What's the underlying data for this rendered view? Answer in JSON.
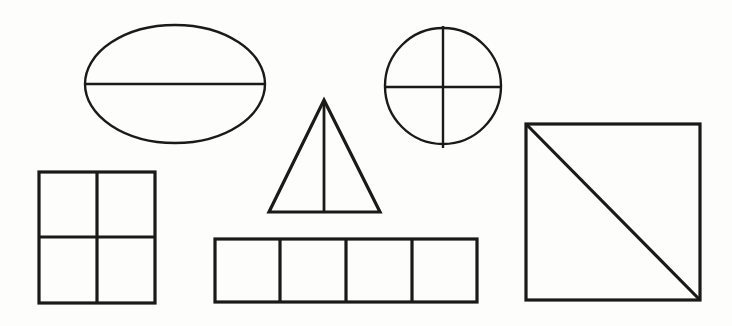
{
  "diagram": {
    "background_color": "#fdfdfc",
    "stroke_color": "#1a1a1a",
    "fill_color": "none",
    "width": 732,
    "height": 326
  },
  "shapes": [
    {
      "id": "ellipse-halves",
      "name": "ellipse",
      "label": "Ellipse divided into halves",
      "parts": 2,
      "fraction": "1/2",
      "division": "horizontal-line",
      "geometry": {
        "cx": 175,
        "cy": 84,
        "rx": 90,
        "ry": 59,
        "stroke_width": 2.4
      },
      "dividers": [
        {
          "x1": 85,
          "y1": 84,
          "x2": 265,
          "y2": 84,
          "stroke_width": 2.4
        }
      ]
    },
    {
      "id": "circle-quarters",
      "name": "circle",
      "label": "Circle divided into quarters",
      "parts": 4,
      "fraction": "1/4",
      "division": "cross-lines",
      "geometry": {
        "cx": 443,
        "cy": 86,
        "r": 58,
        "stroke_width": 2.4
      },
      "dividers": [
        {
          "x1": 443,
          "y1": 26,
          "x2": 443,
          "y2": 148,
          "stroke_width": 2.4
        },
        {
          "x1": 384,
          "y1": 87,
          "x2": 502,
          "y2": 87,
          "stroke_width": 2.4
        }
      ]
    },
    {
      "id": "triangle-halves",
      "name": "triangle",
      "label": "Triangle divided into halves",
      "parts": 2,
      "fraction": "1/2",
      "division": "vertical-line",
      "geometry": {
        "points": "324,100 380,212 269,212",
        "stroke_width": 3.2
      },
      "dividers": [
        {
          "x1": 324,
          "y1": 101,
          "x2": 324,
          "y2": 212,
          "stroke_width": 2.8
        }
      ]
    },
    {
      "id": "square-quarters",
      "name": "square",
      "label": "Square divided into quarters",
      "parts": 4,
      "fraction": "1/4",
      "division": "cross-lines",
      "geometry": {
        "x": 39,
        "y": 172,
        "width": 116,
        "height": 131,
        "stroke_width": 3.2
      },
      "dividers": [
        {
          "x1": 97,
          "y1": 172,
          "x2": 97,
          "y2": 303,
          "stroke_width": 3.2
        },
        {
          "x1": 39,
          "y1": 237,
          "x2": 155,
          "y2": 237,
          "stroke_width": 3.2
        }
      ]
    },
    {
      "id": "rectangle-fourths",
      "name": "rectangle",
      "label": "Rectangle divided into four equal strips",
      "parts": 4,
      "fraction": "1/4",
      "division": "three-vertical-lines",
      "geometry": {
        "x": 215,
        "y": 239,
        "width": 262,
        "height": 63,
        "stroke_width": 3.2
      },
      "dividers": [
        {
          "x1": 280,
          "y1": 239,
          "x2": 280,
          "y2": 302,
          "stroke_width": 3.2
        },
        {
          "x1": 346,
          "y1": 239,
          "x2": 346,
          "y2": 302,
          "stroke_width": 3.2
        },
        {
          "x1": 412,
          "y1": 239,
          "x2": 412,
          "y2": 302,
          "stroke_width": 3.2
        }
      ]
    },
    {
      "id": "big-square-diagonal-halves",
      "name": "square",
      "label": "Large square divided into halves by a diagonal",
      "parts": 2,
      "fraction": "1/2",
      "division": "diagonal-line",
      "geometry": {
        "x": 526,
        "y": 124,
        "width": 174,
        "height": 176,
        "stroke_width": 3.2
      },
      "dividers": [
        {
          "x1": 526,
          "y1": 124,
          "x2": 700,
          "y2": 300,
          "stroke_width": 3.2
        }
      ]
    }
  ]
}
